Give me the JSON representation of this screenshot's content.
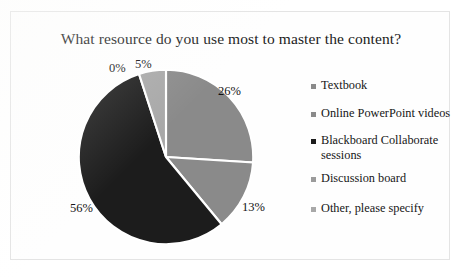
{
  "chart_data": {
    "type": "pie",
    "title": "What resource do you use most to master the content?",
    "categories": [
      "Textbook",
      "Online PowerPoint videos",
      "Blackboard Collaborate sessions",
      "Discussion board",
      "Other, please specify"
    ],
    "values": [
      26,
      13,
      56,
      0,
      5
    ],
    "data_labels": [
      "26%",
      "13%",
      "56%",
      "0%",
      "5%"
    ],
    "unit": "%",
    "colors": [
      "#8a8a8a",
      "#8a8a8a",
      "#1c1c1c",
      "#9b9b9b",
      "#a8a8a8"
    ],
    "slice_border_color": "#ffffff",
    "legend_position": "right",
    "legend_marker": "square",
    "start_angle_deg": 0,
    "direction": "clockwise",
    "grid": false,
    "xlabel": "",
    "ylabel": ""
  },
  "title": {
    "text": "What resource do you use most to master the content?"
  },
  "labels": {
    "textbook": "26%",
    "videos": "13%",
    "blackboard": "56%",
    "discussion": "0%",
    "other": "5%"
  },
  "legend": {
    "items": [
      {
        "label": "Textbook",
        "color": "#8a8a8a",
        "value": 26
      },
      {
        "label": "Online PowerPoint videos",
        "color": "#8a8a8a",
        "value": 13
      },
      {
        "label": "Blackboard Collaborate sessions",
        "color": "#1c1c1c",
        "value": 56
      },
      {
        "label": "Discussion board",
        "color": "#9b9b9b",
        "value": 0
      },
      {
        "label": "Other, please specify",
        "color": "#a8a8a8",
        "value": 5
      }
    ]
  }
}
